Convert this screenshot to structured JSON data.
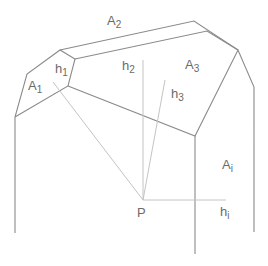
{
  "diagram": {
    "title": "",
    "colors": {
      "edge": "#8a8a8a",
      "height_line": "#c4c4c4",
      "label": "#6a6a6a",
      "background": "#ffffff"
    },
    "labels": {
      "A1": {
        "base": "A",
        "sub": "1"
      },
      "A2": {
        "base": "A",
        "sub": "2"
      },
      "A3": {
        "base": "A",
        "sub": "3"
      },
      "Ai": {
        "base": "A",
        "sub": "i"
      },
      "h1": {
        "base": "h",
        "sub": "1"
      },
      "h2": {
        "base": "h",
        "sub": "2"
      },
      "h3": {
        "base": "h",
        "sub": "3"
      },
      "hi": {
        "base": "h",
        "sub": "i"
      },
      "P": "P"
    },
    "vertices": {
      "P": [
        143,
        200
      ],
      "a": [
        15,
        117
      ],
      "b": [
        27,
        74
      ],
      "c": [
        60,
        50
      ],
      "d": [
        75,
        59
      ],
      "e": [
        68,
        86
      ],
      "f": [
        194,
        21
      ],
      "g": [
        207,
        31
      ],
      "k": [
        238,
        50
      ],
      "m": [
        254,
        87
      ],
      "n": [
        195,
        136
      ]
    }
  }
}
